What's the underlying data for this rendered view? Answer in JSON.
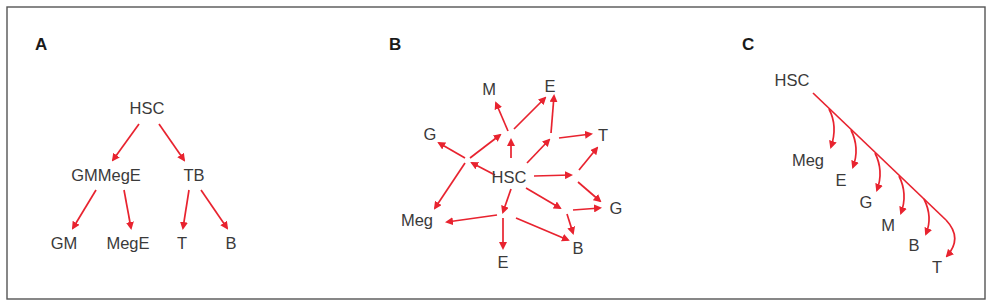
{
  "figure": {
    "frame": {
      "x": 7,
      "y": 7,
      "width": 978,
      "height": 292
    },
    "colors": {
      "arrow": "#e8232f",
      "text": "#3a3a3a",
      "frame": "#555555",
      "background": "#ffffff"
    }
  },
  "panels": [
    {
      "id": "A",
      "letter": "A",
      "letter_pos": [
        35,
        50
      ],
      "title": "Hierarchical binary branching",
      "nodes": [
        {
          "id": "hsc",
          "label": "HSC",
          "x": 147,
          "y": 114
        },
        {
          "id": "gmmege",
          "label": "GMMegE",
          "x": 106,
          "y": 181
        },
        {
          "id": "tb",
          "label": "TB",
          "x": 194,
          "y": 181
        },
        {
          "id": "gm",
          "label": "GM",
          "x": 64,
          "y": 249
        },
        {
          "id": "mege",
          "label": "MegE",
          "x": 128,
          "y": 249
        },
        {
          "id": "t",
          "label": "T",
          "x": 182,
          "y": 249
        },
        {
          "id": "b",
          "label": "B",
          "x": 231,
          "y": 249
        }
      ],
      "arrows": [
        {
          "from": "hsc",
          "to": "gmmege",
          "d": "M139 124 L113 160"
        },
        {
          "from": "hsc",
          "to": "tb",
          "d": "M159 124 L184 160"
        },
        {
          "from": "gmmege",
          "to": "gm",
          "d": "M96 190 L73 228"
        },
        {
          "from": "gmmege",
          "to": "mege",
          "d": "M124 190 L131 228"
        },
        {
          "from": "tb",
          "to": "t",
          "d": "M189 190 L183 228"
        },
        {
          "from": "tb",
          "to": "b",
          "d": "M201 190 L227 228"
        }
      ]
    },
    {
      "id": "B",
      "letter": "B",
      "letter_pos": [
        389,
        50
      ],
      "title": "Network of intermediate progenitors",
      "nodes": [
        {
          "id": "hsc",
          "label": "HSC",
          "x": 509,
          "y": 183
        },
        {
          "id": "m",
          "label": "M",
          "x": 489,
          "y": 95
        },
        {
          "id": "e_top",
          "label": "E",
          "x": 550,
          "y": 92
        },
        {
          "id": "g_left",
          "label": "G",
          "x": 430,
          "y": 140
        },
        {
          "id": "t",
          "label": "T",
          "x": 603,
          "y": 141
        },
        {
          "id": "g_right",
          "label": "G",
          "x": 616,
          "y": 214
        },
        {
          "id": "meg",
          "label": "Meg",
          "x": 417,
          "y": 226
        },
        {
          "id": "e_bottom",
          "label": "E",
          "x": 503,
          "y": 268
        },
        {
          "id": "b",
          "label": "B",
          "x": 578,
          "y": 254
        }
      ],
      "arrows": [
        {
          "d": "M495 175 L472 163"
        },
        {
          "d": "M465 158 L439 143"
        },
        {
          "d": "M470 158 L500 135"
        },
        {
          "d": "M465 163 L435 208"
        },
        {
          "d": "M511 158 L511 140"
        },
        {
          "d": "M508 131 L496 103"
        },
        {
          "d": "M514 129 L545 98"
        },
        {
          "d": "M527 163 L549 140"
        },
        {
          "d": "M551 133 L554 96"
        },
        {
          "d": "M559 138 L591 134"
        },
        {
          "d": "M534 176 L571 175"
        },
        {
          "d": "M579 170 L597 148"
        },
        {
          "d": "M578 182 L600 201"
        },
        {
          "d": "M526 188 L560 208"
        },
        {
          "d": "M573 210 L600 208"
        },
        {
          "d": "M567 214 L573 233"
        },
        {
          "d": "M511 189 L503 212"
        },
        {
          "d": "M497 215 L447 222"
        },
        {
          "d": "M503 218 L503 248"
        },
        {
          "d": "M516 218 L568 240"
        }
      ]
    },
    {
      "id": "C",
      "letter": "C",
      "letter_pos": [
        742,
        50
      ],
      "title": "Sequential myeloid-biased branching",
      "nodes": [
        {
          "id": "hsc",
          "label": "HSC",
          "x": 792,
          "y": 86
        },
        {
          "id": "meg",
          "label": "Meg",
          "x": 808,
          "y": 166
        },
        {
          "id": "e",
          "label": "E",
          "x": 841,
          "y": 186
        },
        {
          "id": "g",
          "label": "G",
          "x": 866,
          "y": 208
        },
        {
          "id": "m",
          "label": "M",
          "x": 888,
          "y": 231
        },
        {
          "id": "b",
          "label": "B",
          "x": 914,
          "y": 251
        },
        {
          "id": "t",
          "label": "T",
          "x": 937,
          "y": 273
        }
      ],
      "trunk": {
        "d": "M813 93 L946 220"
      },
      "arrows": [
        {
          "to": "meg",
          "d": "M829 109 Q838 126 831 147"
        },
        {
          "to": "e",
          "d": "M851 130 Q860 148 853 167"
        },
        {
          "to": "g",
          "d": "M875 153 Q884 171 877 190"
        },
        {
          "to": "m",
          "d": "M899 176 Q908 194 901 213"
        },
        {
          "to": "b",
          "d": "M924 199 Q933 217 926 234"
        },
        {
          "to": "t",
          "d": "M946 220 Q963 238 947 256"
        }
      ]
    }
  ]
}
